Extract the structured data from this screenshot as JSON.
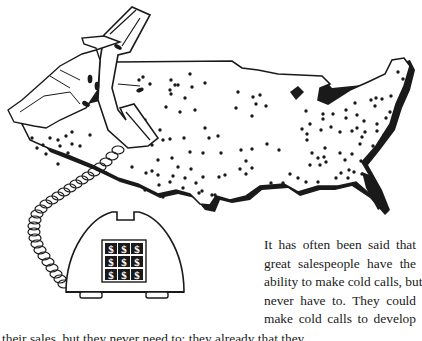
{
  "illustration": {
    "description": "Hand holding telephone handset over dotted map of United States; coiled cord to desk phone with dollar-sign keypad",
    "keypad": {
      "rows": 3,
      "cols": 3,
      "key_glyph": "$"
    }
  },
  "body_text": {
    "lines": [
      "It has often been said that",
      "great salespeople have the",
      "ability to make cold calls, but",
      "never have to. They could",
      "make cold calls to develop"
    ],
    "cut_off_line": "their sales, but they never need to; they already that they..."
  }
}
